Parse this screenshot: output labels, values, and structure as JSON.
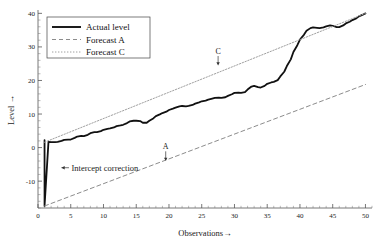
{
  "chart_data": {
    "type": "line",
    "title": "",
    "xlabel": "Observations→",
    "ylabel": "Level →",
    "xlim": [
      0,
      51
    ],
    "ylim": [
      -18,
      41
    ],
    "grid": false,
    "legend_position": "top-left",
    "xticks": [
      0,
      5,
      10,
      15,
      20,
      25,
      30,
      35,
      40,
      45,
      50
    ],
    "xtick_labels": [
      "0",
      "5",
      "10",
      "15",
      "20",
      "25",
      "30",
      "35",
      "40",
      "45",
      "50"
    ],
    "yticks": [
      -10,
      0,
      10,
      20,
      30,
      40
    ],
    "ytick_labels": [
      "-10",
      "0",
      "10",
      "20",
      "30",
      "40"
    ],
    "series": [
      {
        "name": "Actual level",
        "style": "solid",
        "color": "#111111",
        "width": 1.8,
        "x": [
          1,
          1,
          1.6,
          2,
          2.6,
          3,
          3.6,
          4,
          4.6,
          5,
          5.6,
          6,
          6.6,
          7,
          7.6,
          8,
          8.6,
          9,
          9.6,
          10,
          10.6,
          11,
          11.6,
          12,
          12.6,
          13,
          13.6,
          14,
          14.6,
          15,
          15.6,
          16,
          16.6,
          17,
          17.6,
          18,
          18.6,
          19,
          19.6,
          20,
          20.6,
          21,
          21.6,
          22,
          22.6,
          23,
          23.6,
          24,
          24.6,
          25,
          25.6,
          26,
          26.6,
          27,
          27.6,
          28,
          28.6,
          29,
          29.6,
          30,
          30.6,
          31,
          31.6,
          32,
          32.6,
          33,
          33.6,
          34,
          34.6,
          35,
          35.6,
          36,
          36.6,
          37,
          37.6,
          38,
          38.6,
          39,
          39.6,
          40,
          40.6,
          41,
          41.6,
          42,
          42.6,
          43,
          43.6,
          44,
          44.6,
          45,
          45.6,
          46,
          46.6,
          47,
          47.6,
          48,
          48.6,
          49,
          49.6,
          50
        ],
        "y": [
          2.2,
          -17.4,
          1.7,
          1.6,
          1.6,
          1.7,
          2.0,
          2.3,
          2.4,
          2.4,
          2.9,
          3.3,
          3.5,
          3.4,
          3.8,
          4.3,
          4.6,
          4.6,
          4.9,
          5.3,
          5.6,
          5.7,
          6.0,
          6.4,
          6.6,
          6.8,
          7.3,
          7.8,
          8.0,
          8.0,
          7.9,
          7.4,
          7.4,
          8.0,
          8.7,
          9.4,
          9.9,
          10.3,
          10.7,
          11.2,
          11.6,
          11.9,
          12.3,
          12.4,
          12.3,
          12.4,
          12.7,
          13.1,
          13.5,
          13.8,
          14.0,
          14.3,
          14.6,
          14.8,
          14.9,
          14.8,
          15.0,
          15.4,
          15.9,
          16.3,
          16.4,
          16.3,
          16.5,
          17.3,
          18.2,
          18.4,
          18.0,
          17.9,
          18.4,
          19.0,
          19.4,
          19.6,
          20.1,
          21.2,
          22.6,
          24.3,
          26.3,
          28.5,
          30.5,
          32.2,
          33.6,
          34.8,
          35.6,
          35.8,
          35.7,
          35.6,
          35.8,
          36.1,
          36.4,
          36.3,
          35.9,
          35.9,
          36.4,
          37.0,
          37.5,
          38.0,
          38.5,
          39.1,
          39.6,
          40.0
        ]
      },
      {
        "name": "Forecast A",
        "style": "dashed",
        "color": "#8c8c8c",
        "width": 1.0,
        "x": [
          1,
          50
        ],
        "y": [
          -17.4,
          18.8
        ]
      },
      {
        "name": "Forecast C",
        "style": "dotted",
        "color": "#a0a0a0",
        "width": 1.0,
        "x": [
          1,
          50
        ],
        "y": [
          1.6,
          40.0
        ]
      }
    ],
    "annotations": [
      {
        "text": "Intercept correction",
        "x": 4.5,
        "y": -6.0,
        "arrow": "left"
      },
      {
        "text": "A",
        "x": 19.5,
        "y": -3.2,
        "arrow": "down"
      },
      {
        "text": "C",
        "x": 27.5,
        "y": 25.2,
        "arrow": "down"
      }
    ]
  },
  "legend": {
    "items": [
      {
        "label": "Actual level",
        "style": "solid"
      },
      {
        "label": "Forecast A",
        "style": "dashed"
      },
      {
        "label": "Forecast C",
        "style": "dotted"
      }
    ]
  },
  "axes": {
    "x_title": "Observations→",
    "y_title": "Level →"
  },
  "colors": {
    "actual": "#111111",
    "forecast_a": "#8c8c8c",
    "forecast_c": "#a0a0a0",
    "axis": "#555555",
    "text": "#1a1a1a",
    "background": "#ffffff"
  }
}
